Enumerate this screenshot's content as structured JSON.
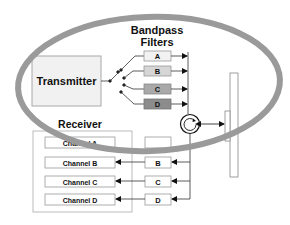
{
  "diagram": {
    "title": "Bandpass Filters",
    "title_line1": "Bandpass",
    "title_line2": "Filters",
    "transmitter": {
      "label": "Transmitter"
    },
    "tx_filters": [
      {
        "label": "A",
        "fill": "#f2f2f2"
      },
      {
        "label": "B",
        "fill": "#d6d6d6"
      },
      {
        "label": "C",
        "fill": "#a9a9a9"
      },
      {
        "label": "D",
        "fill": "#8c8c8c"
      }
    ],
    "receiver": {
      "label": "Receiver",
      "channels": [
        {
          "label": "Channel A"
        },
        {
          "label": "Channel B"
        },
        {
          "label": "Channel C"
        },
        {
          "label": "Channel D"
        }
      ]
    },
    "rx_filters": [
      {
        "label": "A"
      },
      {
        "label": "B"
      },
      {
        "label": "C"
      },
      {
        "label": "D"
      }
    ],
    "circulator": {
      "icon": "circulator-icon"
    },
    "antenna": {
      "icon": "antenna-icon"
    },
    "highlight_ellipse": {
      "color": "#9a9a9a"
    }
  }
}
